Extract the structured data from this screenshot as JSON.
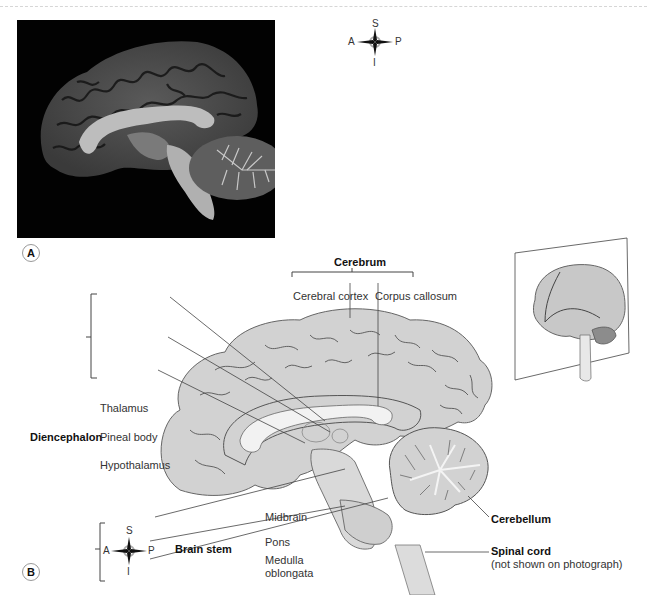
{
  "figure": {
    "panels": [
      {
        "id": "A",
        "label": "A",
        "kind": "mri-photograph-midsagittal-brain"
      },
      {
        "id": "B",
        "label": "B",
        "kind": "labelled-diagram-midsagittal-brain"
      }
    ],
    "compass": {
      "superior": "S",
      "inferior": "I",
      "anterior": "A",
      "posterior": "P"
    },
    "group_labels": {
      "cerebrum": "Cerebrum",
      "diencephalon": "Diencephalon",
      "brain_stem": "Brain stem"
    },
    "labels": {
      "cerebral_cortex": "Cerebral cortex",
      "corpus_callosum": "Corpus callosum",
      "thalamus": "Thalamus",
      "pineal_body": "Pineal body",
      "hypothalamus": "Hypothalamus",
      "midbrain": "Midbrain",
      "pons": "Pons",
      "medulla_line1": "Medulla",
      "medulla_line2": "oblongata",
      "cerebellum": "Cerebellum",
      "spinal_cord": "Spinal cord",
      "spinal_cord_note": "(not shown on photograph)"
    },
    "colors": {
      "brain_fill": "#d2d2d2",
      "white_matter": "#f2f2f2",
      "outline": "#555555",
      "cerebellum_dark": "#8c8c8c",
      "photo_bg": "#020202"
    }
  }
}
